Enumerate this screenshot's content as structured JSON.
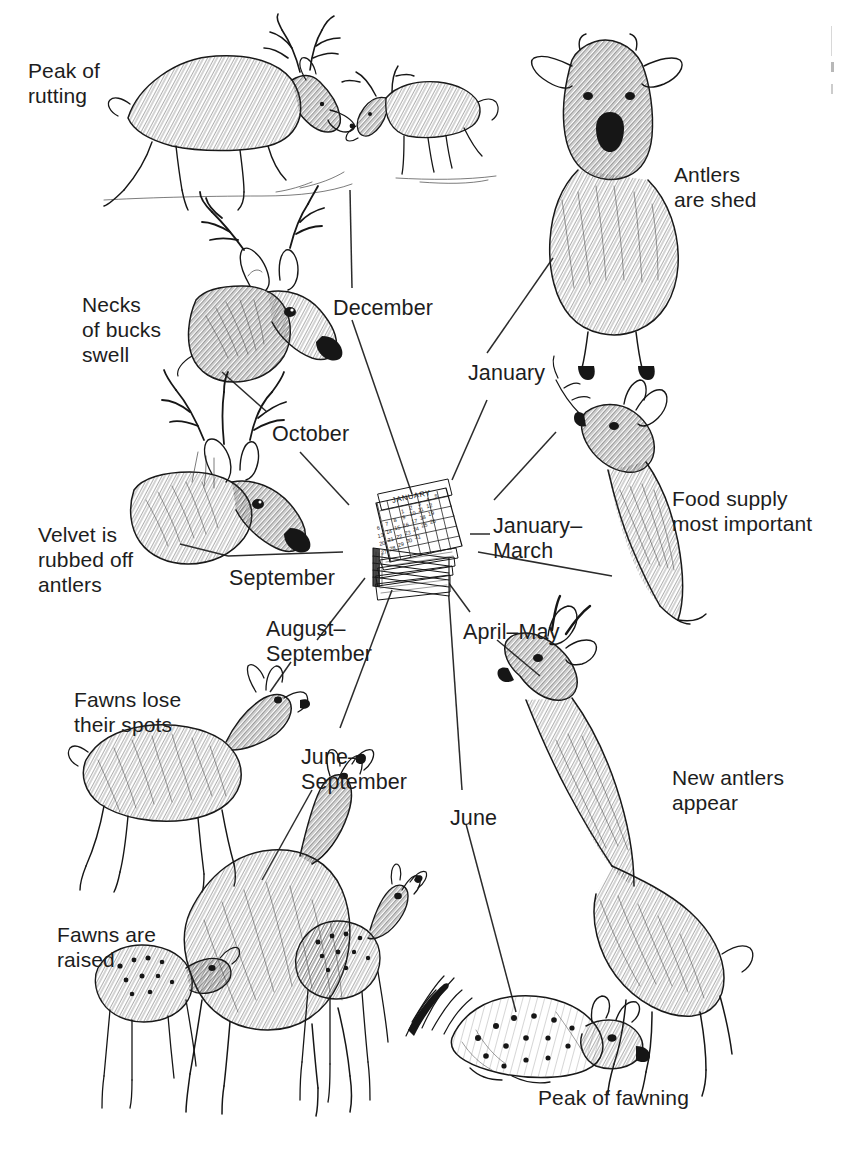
{
  "diagram": {
    "type": "radial-cycle",
    "center": {
      "name": "calendar-illustration",
      "month_on_page": "JANUARY",
      "weekday_headers": [
        "S",
        "M",
        "T",
        "W",
        "T",
        "F",
        "S"
      ],
      "day_numbers": [
        [
          null,
          null,
          1,
          2,
          3,
          4,
          5
        ],
        [
          6,
          7,
          8,
          9,
          10,
          11,
          12
        ],
        [
          13,
          14,
          15,
          16,
          17,
          18,
          19
        ],
        [
          20,
          21,
          22,
          23,
          24,
          25,
          26
        ],
        [
          27,
          28,
          29,
          30,
          31,
          null,
          null
        ]
      ]
    },
    "ink_color": "#161616",
    "text_color": "#1d1d1d",
    "connector_color": "#2b2b2b",
    "background": "#ffffff"
  },
  "months": [
    {
      "id": "december",
      "label": "December",
      "x": 333,
      "y": 296
    },
    {
      "id": "january",
      "label": "January",
      "x": 468,
      "y": 361
    },
    {
      "id": "january-march",
      "label": "January–\nMarch",
      "x": 493,
      "y": 514
    },
    {
      "id": "april-may",
      "label": "April–May",
      "x": 463,
      "y": 620
    },
    {
      "id": "june",
      "label": "June",
      "x": 450,
      "y": 806
    },
    {
      "id": "june-september",
      "label": "June–\nSeptember",
      "x": 301,
      "y": 745
    },
    {
      "id": "august-september",
      "label": "August–\nSeptember",
      "x": 266,
      "y": 617
    },
    {
      "id": "september",
      "label": "September",
      "x": 229,
      "y": 566
    },
    {
      "id": "october",
      "label": "October",
      "x": 272,
      "y": 422
    }
  ],
  "captions": [
    {
      "id": "peak-of-rutting",
      "label": "Peak of\nrutting",
      "x": 28,
      "y": 58
    },
    {
      "id": "antlers-are-shed",
      "label": "Antlers\nare shed",
      "x": 674,
      "y": 162
    },
    {
      "id": "necks-of-bucks-swell",
      "label": "Necks\nof bucks\nswell",
      "x": 82,
      "y": 292
    },
    {
      "id": "velvet-rubbed-off",
      "label": "Velvet is\nrubbed off\nantlers",
      "x": 38,
      "y": 522
    },
    {
      "id": "food-supply",
      "label": "Food supply\nmost important",
      "x": 672,
      "y": 486
    },
    {
      "id": "fawns-lose-spots",
      "label": "Fawns lose\ntheir spots",
      "x": 74,
      "y": 687
    },
    {
      "id": "new-antlers-appear",
      "label": "New antlers\nappear",
      "x": 672,
      "y": 765
    },
    {
      "id": "fawns-are-raised",
      "label": "Fawns are\nraised",
      "x": 57,
      "y": 922
    },
    {
      "id": "peak-of-fawning",
      "label": "Peak of fawning",
      "x": 538,
      "y": 1085
    }
  ],
  "illustrations": [
    {
      "id": "rutting-bucks",
      "name": "two-rutting-bucks-sparring",
      "subject": "buck"
    },
    {
      "id": "buck-head-swollen-neck",
      "name": "buck-head-with-swollen-neck",
      "subject": "buck"
    },
    {
      "id": "buck-rubbing-velvet",
      "name": "buck-head-rubbing-velvet",
      "subject": "buck"
    },
    {
      "id": "shed-antler-buck",
      "name": "buck-with-shed-antlers",
      "subject": "buck"
    },
    {
      "id": "doe-browsing",
      "name": "doe-browsing-twig",
      "subject": "doe"
    },
    {
      "id": "fawn-losing-spots",
      "name": "fawn-losing-spots",
      "subject": "fawn"
    },
    {
      "id": "buck-new-antlers",
      "name": "buck-with-velvet-antlers",
      "subject": "buck"
    },
    {
      "id": "doe-with-fawns",
      "name": "doe-nursing-two-fawns",
      "subject": "doe"
    },
    {
      "id": "newborn-fawn",
      "name": "newborn-fawn-bedded",
      "subject": "fawn"
    }
  ],
  "connectors": [
    {
      "id": "c-december",
      "x1": 352,
      "y1": 320,
      "x2": 412,
      "y2": 494
    },
    {
      "id": "c-rutting",
      "x1": 350,
      "y1": 190,
      "x2": 352,
      "y2": 288
    },
    {
      "id": "c-january",
      "x1": 487,
      "y1": 353,
      "x2": 553,
      "y2": 258
    },
    {
      "id": "c-january-b",
      "x1": 452,
      "y1": 480,
      "x2": 487,
      "y2": 400
    },
    {
      "id": "c-january-march",
      "x1": 478,
      "y1": 552,
      "x2": 612,
      "y2": 576
    },
    {
      "id": "c-january-march-b",
      "x1": 470,
      "y1": 534,
      "x2": 490,
      "y2": 534
    },
    {
      "id": "c-april-may",
      "x1": 437,
      "y1": 567,
      "x2": 470,
      "y2": 612
    },
    {
      "id": "c-april-may-b",
      "x1": 497,
      "y1": 640,
      "x2": 540,
      "y2": 676
    },
    {
      "id": "c-june",
      "x1": 448,
      "y1": 584,
      "x2": 462,
      "y2": 790
    },
    {
      "id": "c-june-b",
      "x1": 466,
      "y1": 824,
      "x2": 516,
      "y2": 1012
    },
    {
      "id": "c-june-september",
      "x1": 392,
      "y1": 590,
      "x2": 340,
      "y2": 728
    },
    {
      "id": "c-june-september-b",
      "x1": 312,
      "y1": 790,
      "x2": 262,
      "y2": 880
    },
    {
      "id": "c-august-september",
      "x1": 365,
      "y1": 578,
      "x2": 317,
      "y2": 640
    },
    {
      "id": "c-august-september-b",
      "x1": 291,
      "y1": 662,
      "x2": 270,
      "y2": 692
    },
    {
      "id": "c-september",
      "x1": 343,
      "y1": 552,
      "x2": 228,
      "y2": 556
    },
    {
      "id": "c-september-b",
      "x1": 228,
      "y1": 556,
      "x2": 180,
      "y2": 544
    },
    {
      "id": "c-october",
      "x1": 349,
      "y1": 505,
      "x2": 300,
      "y2": 452
    },
    {
      "id": "c-october-b",
      "x1": 267,
      "y1": 412,
      "x2": 222,
      "y2": 372
    },
    {
      "id": "c-food",
      "x1": 494,
      "y1": 500,
      "x2": 556,
      "y2": 432
    }
  ]
}
